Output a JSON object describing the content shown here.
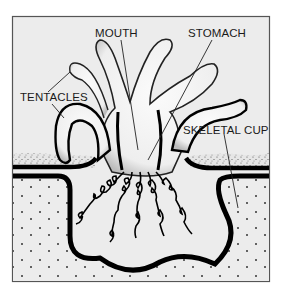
{
  "diagram": {
    "labels": {
      "mouth": "MOUTH",
      "stomach": "STOMACH",
      "tentacles": "TENTACLES",
      "skeletal_cup": "SKELETAL CUP"
    },
    "colors": {
      "page_background": "#ffffff",
      "frame_fill": "#ececec",
      "frame_border": "#555555",
      "outline": "#000000",
      "body_fill": "#f7f7f7",
      "ink": "#1a1a1a"
    }
  }
}
